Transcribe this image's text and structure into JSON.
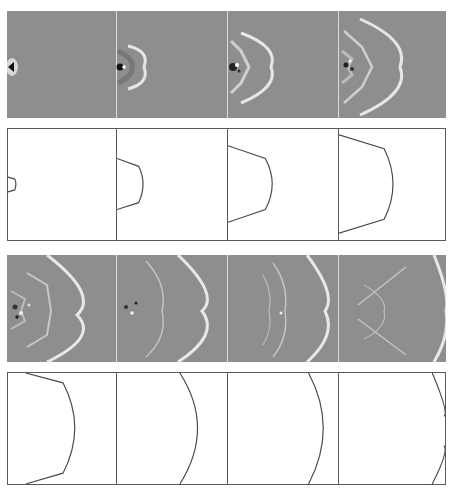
{
  "figure": {
    "colors": {
      "field_background": "#8e8e8e",
      "wavefront": "#e8e8e8",
      "contour_line": "#4a4a4a",
      "contour_frame": "#5a5a5a"
    },
    "columns_x": [
      7,
      116,
      227,
      338,
      446
    ],
    "rows": [
      {
        "type": "field",
        "y": 11,
        "h": 107,
        "frames": [
          1,
          2,
          3,
          4
        ]
      },
      {
        "type": "contour",
        "y": 128,
        "h": 112,
        "frames": [
          1,
          2,
          3,
          4
        ]
      },
      {
        "type": "field",
        "y": 255,
        "h": 107,
        "frames": [
          5,
          6,
          7,
          8
        ]
      },
      {
        "type": "contour",
        "y": 372,
        "h": 112,
        "frames": [
          5,
          6,
          7,
          8
        ]
      }
    ],
    "front_positions_fraction_of_width": [
      0.08,
      0.28,
      0.5,
      0.78,
      0.92,
      1.0,
      1.0,
      1.0
    ]
  }
}
